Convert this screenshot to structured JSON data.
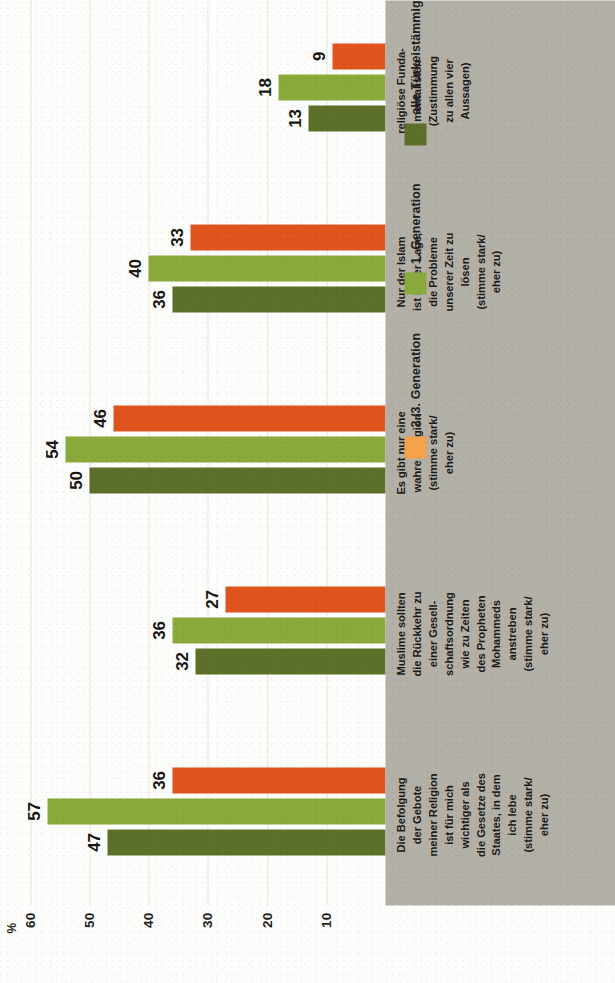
{
  "chart_data": {
    "type": "bar",
    "orientation": "horizontal",
    "title": "",
    "xlabel": "",
    "ylabel": "%",
    "unit_label": "%",
    "ylim": [
      0,
      65
    ],
    "ticks": [
      60,
      50,
      40,
      30,
      20,
      10
    ],
    "grid": true,
    "legend_position": "top-right",
    "categories": [
      "Die Befolgung der Gebote meiner Religion ist für mich wichtiger als die Gesetze des Staates, in dem ich lebe (stimme stark/ eher zu)",
      "Muslime sollten die Rückkehr zu einer Gesellschaftsordnung wie zu Zeiten des Propheten Mohammeds anstreben (stimme stark/ eher zu)",
      "Es gibt nur eine wahre Religion (stimme stark/ eher zu)",
      "Nur der Islam ist in der Lage, die Probleme unserer Zeit zu lösen (stimme stark/ eher zu)",
      "religiöse Fundamentalisten (Zustimmung zu allen vier Aussagen)"
    ],
    "category_lines": [
      [
        "Die Befolgung",
        "der Gebote",
        "meiner Religion",
        "ist für mich",
        "wichtiger als",
        "die Gesetze des",
        "Staates, in dem",
        "ich lebe",
        "(stimme stark/",
        "eher zu)"
      ],
      [
        "Muslime sollten",
        "die Rückkehr zu",
        "einer Gesell-",
        "schaftsordnung",
        "wie zu Zeiten",
        "des Propheten",
        "Mohammeds",
        "anstreben",
        "(stimme stark/",
        "eher zu)"
      ],
      [
        "Es gibt nur eine",
        "wahre Religion",
        "(stimme stark/",
        "eher zu)"
      ],
      [
        "Nur der Islam",
        "ist in der Lage,",
        "die Probleme",
        "unserer Zeit zu",
        "lösen",
        "(stimme stark/",
        "eher zu)"
      ],
      [
        "religiöse Funda-",
        "mentalisten",
        "(Zustimmung",
        "zu allen vier",
        "Aussagen)"
      ]
    ],
    "series": [
      {
        "name": "alle Türkeistämmigen",
        "color": "#5d7029",
        "values": [
          47,
          32,
          50,
          36,
          13
        ]
      },
      {
        "name": "1. Generation",
        "color": "#8aaa3c",
        "values": [
          57,
          36,
          54,
          40,
          18
        ]
      },
      {
        "name": "2./3. Generation",
        "color": "#e0541e",
        "values": [
          36,
          27,
          46,
          33,
          9
        ]
      }
    ]
  },
  "legend": {
    "items": [
      {
        "label": "2./3. Generation",
        "color": "#f6a24b"
      },
      {
        "label": "1. Generation",
        "color": "#8aaa3c"
      },
      {
        "label": "alle Türkeistämmigen",
        "color": "#5d7029"
      }
    ]
  },
  "axis": {
    "unit": "%",
    "ticks": [
      "60",
      "50",
      "40",
      "30",
      "20",
      "10"
    ]
  },
  "colors": {
    "band": "#b3b0a8",
    "grid": "#e8e6de",
    "paper": "#fdfdfb",
    "text": "#1c1a17"
  }
}
